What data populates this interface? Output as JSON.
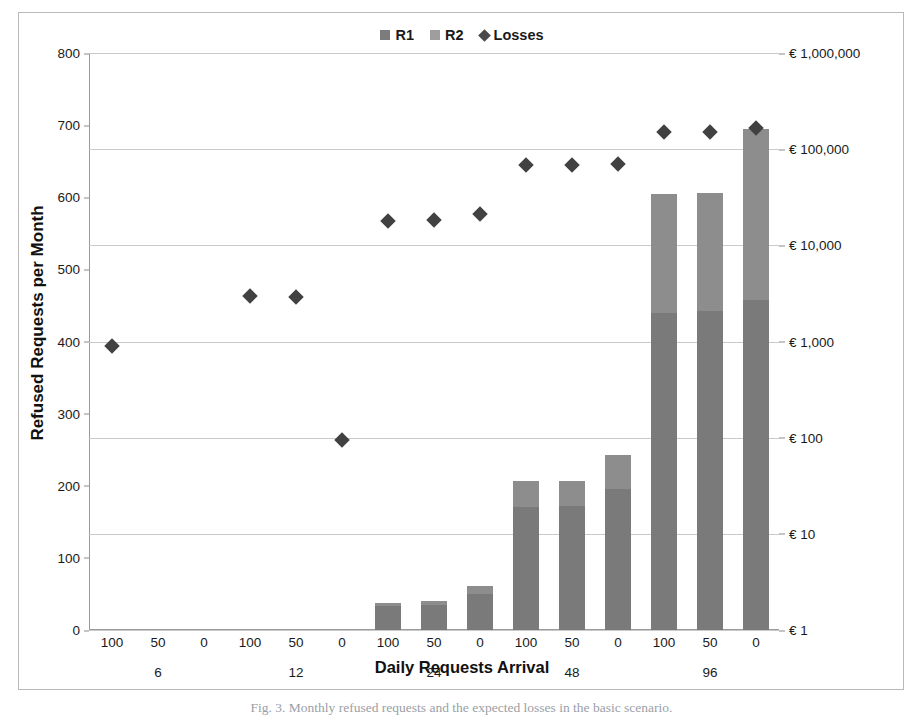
{
  "chart_data": {
    "type": "bar",
    "title": "",
    "xlabel": "Daily Requests Arrival",
    "ylabel": "Refused Requests per Month",
    "y2label": "Expected Losses",
    "ylim": [
      0,
      800
    ],
    "yticks": [
      0,
      100,
      200,
      300,
      400,
      500,
      600,
      700,
      800
    ],
    "y2_scale": "log",
    "y2lim": [
      1,
      1000000
    ],
    "y2ticks": [
      "€ 1",
      "€ 10",
      "€ 100",
      "€ 1,000",
      "€ 10,000",
      "€ 100,000",
      "€ 1,000,000"
    ],
    "y2tick_values": [
      1,
      10,
      100,
      1000,
      10000,
      100000,
      1000000
    ],
    "grid": "horizontal-on-secondary-axis",
    "legend_position": "top-center",
    "legend": [
      "R1",
      "R2",
      "Losses"
    ],
    "group_labels": [
      "6",
      "12",
      "24",
      "48",
      "96"
    ],
    "subgroup_labels": [
      "100",
      "50",
      "0"
    ],
    "categories": [
      "6/100",
      "6/50",
      "6/0",
      "12/100",
      "12/50",
      "12/0",
      "24/100",
      "24/50",
      "24/0",
      "48/100",
      "48/50",
      "48/0",
      "96/100",
      "96/50",
      "96/0"
    ],
    "series": [
      {
        "name": "R1",
        "axis": "left",
        "color": "#7a7a7a",
        "values": [
          0,
          0,
          0,
          0,
          0,
          0,
          33,
          35,
          50,
          170,
          172,
          195,
          440,
          443,
          458
        ]
      },
      {
        "name": "R2",
        "axis": "left",
        "color": "#8d8d8d",
        "values": [
          0,
          0,
          0,
          0,
          0,
          0,
          5,
          5,
          11,
          36,
          34,
          47,
          165,
          163,
          237
        ]
      },
      {
        "name": "Losses",
        "axis": "right-log",
        "color": "#414141",
        "marker": "diamond",
        "values_left_equivalent": [
          391,
          null,
          null,
          450,
          449,
          266,
          562,
          563,
          571,
          643,
          643,
          646,
          698,
          698,
          704
        ],
        "values": [
          900,
          null,
          null,
          3000,
          2900,
          95,
          18000,
          18500,
          21000,
          68000,
          68000,
          70000,
          150000,
          150000,
          165000
        ]
      }
    ]
  },
  "legend": {
    "items": [
      {
        "label": "R1",
        "marker": "square"
      },
      {
        "label": "R2",
        "marker": "square"
      },
      {
        "label": "Losses",
        "marker": "diamond"
      }
    ]
  },
  "axes": {
    "left_title": "Refused Requests per Month",
    "right_title": "Expected Losses",
    "bottom_title": "Daily Requests Arrival",
    "left_ticks": [
      "800",
      "700",
      "600",
      "500",
      "400",
      "300",
      "200",
      "100",
      "0"
    ],
    "right_ticks": [
      "€ 1,000,000",
      "€ 100,000",
      "€ 10,000",
      "€ 1,000",
      "€ 100",
      "€ 10",
      "€ 1"
    ],
    "x_ticks": [
      "100",
      "50",
      "0",
      "100",
      "50",
      "0",
      "100",
      "50",
      "0",
      "100",
      "50",
      "0",
      "100",
      "50",
      "0"
    ],
    "x_groups": [
      "6",
      "12",
      "24",
      "48",
      "96"
    ]
  },
  "caption": "Fig. 3. Monthly refused requests and the expected losses in the basic scenario."
}
